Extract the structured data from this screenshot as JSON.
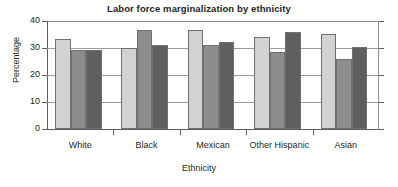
{
  "chart_data": {
    "type": "bar",
    "title": "Labor force marginalization by ethnicity",
    "xlabel": "Ethnicity",
    "ylabel": "Percentage",
    "categories": [
      "White",
      "Black",
      "Mexican",
      "Other Hispanic",
      "Asian"
    ],
    "series": [
      {
        "name": "series-1",
        "color": "#d2d2d2",
        "values": [
          33.5,
          30.0,
          36.7,
          34.0,
          35.2
        ]
      },
      {
        "name": "series-2",
        "color": "#8d8d8d",
        "values": [
          29.2,
          36.5,
          31.1,
          28.7,
          26.0
        ]
      },
      {
        "name": "series-3",
        "color": "#5f5f5f",
        "values": [
          29.1,
          31.2,
          32.4,
          36.1,
          30.3
        ]
      }
    ],
    "ylim": [
      0,
      40
    ],
    "yticks": [
      0,
      10,
      20,
      30,
      40
    ],
    "ytick_labels": [
      "0",
      "10",
      "20",
      "30",
      "40"
    ],
    "grid": true,
    "gridlines_at": [
      10,
      20,
      30
    ],
    "legend": "none",
    "legend_position": "none"
  },
  "axes": {
    "y_tick_0": "0",
    "y_tick_1": "10",
    "y_tick_2": "20",
    "y_tick_3": "30",
    "y_tick_4": "40"
  },
  "categories": {
    "c0": "White",
    "c1": "Black",
    "c2": "Mexican",
    "c3": "Other Hispanic",
    "c4": "Asian"
  }
}
